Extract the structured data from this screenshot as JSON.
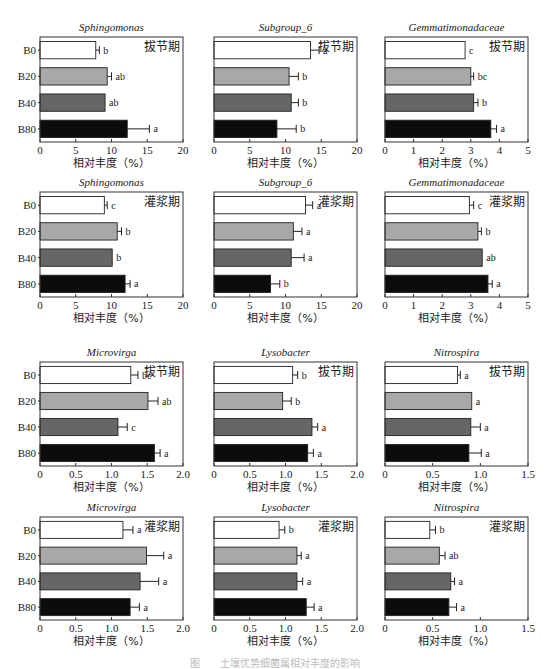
{
  "chart_data": {
    "type": "bar",
    "orientation": "horizontal",
    "categories": [
      "B0",
      "B20",
      "B40",
      "B80"
    ],
    "bar_colors": [
      "#ffffff",
      "#a8a8a8",
      "#666666",
      "#0c0c0c"
    ],
    "xlabel": "相对丰度（%）",
    "panels": [
      {
        "title": "Sphingomonas",
        "stage": "拔节期",
        "xlim": [
          0,
          20
        ],
        "ticks": [
          "0",
          "5",
          "10",
          "15",
          "20"
        ],
        "tick_values": [
          0,
          5,
          10,
          15,
          20
        ],
        "values": [
          7.8,
          9.4,
          9.1,
          12.2
        ],
        "errors": [
          0.5,
          0.6,
          0,
          3.1
        ],
        "letters": [
          "b",
          "ab",
          "ab",
          "a"
        ]
      },
      {
        "title": "Subgroup_6",
        "stage": "拔节期",
        "xlim": [
          0,
          20
        ],
        "ticks": [
          "0",
          "5",
          "10",
          "15",
          "20"
        ],
        "tick_values": [
          0,
          5,
          10,
          15,
          20
        ],
        "values": [
          13.5,
          10.5,
          10.8,
          8.8
        ],
        "errors": [
          1.2,
          1.3,
          1.0,
          2.7
        ],
        "letters": [
          "a",
          "b",
          "b",
          "b"
        ]
      },
      {
        "title": "Gemmatimonadaceae",
        "stage": "拔节期",
        "xlim": [
          0,
          5
        ],
        "ticks": [
          "0",
          "1",
          "2",
          "3",
          "4",
          "5"
        ],
        "tick_values": [
          0,
          1,
          2,
          3,
          4,
          5
        ],
        "values": [
          2.8,
          3.0,
          3.1,
          3.7
        ],
        "errors": [
          0,
          0.1,
          0.15,
          0.2
        ],
        "letters": [
          "c",
          "bc",
          "b",
          "a"
        ]
      },
      {
        "title": "Sphingomonas",
        "stage": "灌浆期",
        "xlim": [
          0,
          20
        ],
        "ticks": [
          "0",
          "5",
          "10",
          "15",
          "20"
        ],
        "tick_values": [
          0,
          5,
          10,
          15,
          20
        ],
        "values": [
          9.0,
          10.8,
          10.1,
          11.9
        ],
        "errors": [
          0.4,
          0.6,
          0,
          0.7
        ],
        "letters": [
          "c",
          "b",
          "b",
          "a"
        ]
      },
      {
        "title": "Subgroup_6",
        "stage": "灌浆期",
        "xlim": [
          0,
          20
        ],
        "ticks": [
          "0",
          "5",
          "10",
          "15",
          "20"
        ],
        "tick_values": [
          0,
          5,
          10,
          15,
          20
        ],
        "values": [
          12.8,
          11.1,
          10.8,
          7.9
        ],
        "errors": [
          1.0,
          1.2,
          1.8,
          1.3
        ],
        "letters": [
          "a",
          "a",
          "a",
          "b"
        ]
      },
      {
        "title": "Gemmatimonadaceae",
        "stage": "灌浆期",
        "xlim": [
          0,
          5
        ],
        "ticks": [
          "0",
          "1",
          "2",
          "3",
          "4",
          "5"
        ],
        "tick_values": [
          0,
          1,
          2,
          3,
          4,
          5
        ],
        "values": [
          2.95,
          3.25,
          3.4,
          3.6
        ],
        "errors": [
          0.15,
          0.12,
          0,
          0.15
        ],
        "letters": [
          "c",
          "b",
          "ab",
          "a"
        ]
      },
      {
        "title": "Microvirga",
        "stage": "拔节期",
        "xlim": [
          0,
          2.0
        ],
        "ticks": [
          "0",
          "0.5",
          "1.0",
          "1.5",
          "2.0"
        ],
        "tick_values": [
          0,
          0.5,
          1.0,
          1.5,
          2.0
        ],
        "values": [
          1.27,
          1.51,
          1.09,
          1.6
        ],
        "errors": [
          0.1,
          0.14,
          0.13,
          0.08
        ],
        "letters": [
          "bc",
          "ab",
          "c",
          "a"
        ]
      },
      {
        "title": "Lysobacter",
        "stage": "拔节期",
        "xlim": [
          0,
          2.0
        ],
        "ticks": [
          "0",
          "0.5",
          "1.0",
          "1.5",
          "2.0"
        ],
        "tick_values": [
          0,
          0.5,
          1.0,
          1.5,
          2.0
        ],
        "values": [
          1.1,
          0.96,
          1.37,
          1.31
        ],
        "errors": [
          0.07,
          0.12,
          0.08,
          0.08
        ],
        "letters": [
          "b",
          "b",
          "a",
          "a"
        ]
      },
      {
        "title": "Nitrospira",
        "stage": "拔节期",
        "xlim": [
          0,
          1.5
        ],
        "ticks": [
          "0",
          "0.5",
          "1.0",
          "1.5"
        ],
        "tick_values": [
          0,
          0.5,
          1.0,
          1.5
        ],
        "values": [
          0.76,
          0.91,
          0.9,
          0.88
        ],
        "errors": [
          0.03,
          0,
          0.1,
          0.13
        ],
        "letters": [
          "a",
          "a",
          "a",
          "a"
        ]
      },
      {
        "title": "Microvirga",
        "stage": "灌浆期",
        "xlim": [
          0,
          2.0
        ],
        "ticks": [
          "0",
          "0.5",
          "1.0",
          "1.5",
          "2.0"
        ],
        "tick_values": [
          0,
          0.5,
          1.0,
          1.5,
          2.0
        ],
        "values": [
          1.16,
          1.49,
          1.4,
          1.26
        ],
        "errors": [
          0.14,
          0.24,
          0.26,
          0.13
        ],
        "letters": [
          "a",
          "a",
          "a",
          "a"
        ]
      },
      {
        "title": "Lysobacter",
        "stage": "灌浆期",
        "xlim": [
          0,
          2.0
        ],
        "ticks": [
          "0",
          "0.5",
          "1.0",
          "1.5",
          "2.0"
        ],
        "tick_values": [
          0,
          0.5,
          1.0,
          1.5,
          2.0
        ],
        "values": [
          0.91,
          1.16,
          1.16,
          1.29
        ],
        "errors": [
          0.08,
          0.06,
          0.08,
          0.11
        ],
        "letters": [
          "b",
          "a",
          "a",
          "a"
        ]
      },
      {
        "title": "Nitrospira",
        "stage": "灌浆期",
        "xlim": [
          0,
          1.5
        ],
        "ticks": [
          "0",
          "0.5",
          "1.0",
          "1.5"
        ],
        "tick_values": [
          0,
          0.5,
          1.0,
          1.5
        ],
        "values": [
          0.47,
          0.57,
          0.69,
          0.67
        ],
        "errors": [
          0.06,
          0.06,
          0.04,
          0.08
        ],
        "letters": [
          "b",
          "ab",
          "a",
          "a"
        ]
      }
    ]
  },
  "caption": "图　　土壤优势细菌属相对丰度的影响"
}
